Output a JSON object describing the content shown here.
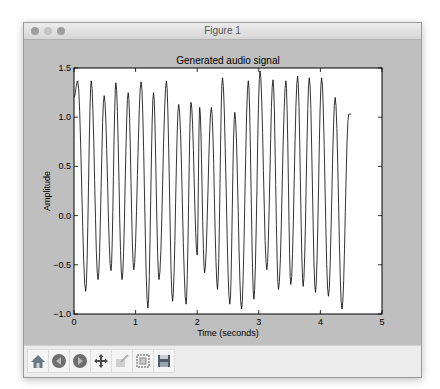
{
  "window": {
    "title": "Figure 1",
    "traffic_lights": [
      "close",
      "minimize",
      "zoom"
    ]
  },
  "toolbar": {
    "buttons": [
      {
        "name": "home",
        "icon": "home-icon"
      },
      {
        "name": "back",
        "icon": "back-arrow-icon"
      },
      {
        "name": "forward",
        "icon": "forward-arrow-icon"
      },
      {
        "name": "pan",
        "icon": "move-cross-icon"
      },
      {
        "name": "zoom",
        "icon": "zoom-rect-icon"
      },
      {
        "name": "configure-subplots",
        "icon": "subplots-icon"
      },
      {
        "name": "save",
        "icon": "floppy-disk-icon"
      }
    ]
  },
  "chart_data": {
    "type": "line",
    "title": "Generated audio signal",
    "xlabel": "Time (seconds)",
    "ylabel": "Amplitude",
    "xlim": [
      0,
      5
    ],
    "ylim": [
      -1.0,
      1.5
    ],
    "xticks": [
      "0",
      "1",
      "2",
      "3",
      "4",
      "5"
    ],
    "yticks": [
      "−1.0",
      "−0.5",
      "0.0",
      "0.5",
      "1.0",
      "1.5"
    ],
    "grid": false,
    "legend": null,
    "line_color": "#000000",
    "series": [
      {
        "name": "signal",
        "x": [
          0.0,
          0.06,
          0.19,
          0.28,
          0.39,
          0.49,
          0.6,
          0.68,
          0.78,
          0.88,
          0.97,
          1.09,
          1.2,
          1.29,
          1.38,
          1.5,
          1.6,
          1.7,
          1.82,
          1.9,
          2.0,
          2.04,
          2.12,
          2.23,
          2.33,
          2.41,
          2.53,
          2.61,
          2.72,
          2.83,
          2.92,
          3.02,
          3.13,
          3.23,
          3.32,
          3.44,
          3.52,
          3.63,
          3.72,
          3.82,
          3.92,
          4.02,
          4.13,
          4.24,
          4.35,
          4.46,
          4.5
        ],
        "values": [
          1.2,
          1.37,
          -0.77,
          1.37,
          -0.65,
          1.22,
          -0.56,
          1.35,
          -0.65,
          1.25,
          -0.55,
          1.36,
          -0.94,
          1.25,
          -0.65,
          1.37,
          -0.87,
          1.13,
          -0.9,
          1.15,
          -0.4,
          1.1,
          -0.58,
          1.1,
          -0.75,
          1.4,
          -0.9,
          1.05,
          -0.95,
          1.37,
          -0.85,
          1.47,
          -0.55,
          1.38,
          -0.75,
          1.37,
          -0.7,
          1.42,
          -0.72,
          1.4,
          -0.78,
          1.4,
          -0.82,
          1.2,
          -0.95,
          1.03,
          1.03
        ]
      }
    ]
  }
}
